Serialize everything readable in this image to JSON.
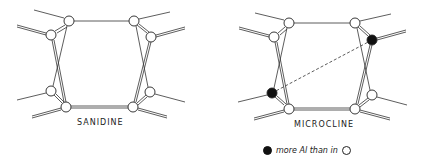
{
  "figure": {
    "panels": [
      {
        "id": "sanidine",
        "label": "SANIDINE",
        "nodes": [
          {
            "x": 69,
            "y": 21,
            "type": "open"
          },
          {
            "x": 51,
            "y": 35,
            "type": "open"
          },
          {
            "x": 134,
            "y": 21,
            "type": "open"
          },
          {
            "x": 151,
            "y": 37,
            "type": "open"
          },
          {
            "x": 51,
            "y": 91,
            "type": "open"
          },
          {
            "x": 66,
            "y": 107,
            "type": "open"
          },
          {
            "x": 133,
            "y": 107,
            "type": "open"
          },
          {
            "x": 150,
            "y": 92,
            "type": "open"
          }
        ]
      },
      {
        "id": "microcline",
        "label": "MICROCLINE",
        "nodes": [
          {
            "x": 289,
            "y": 23,
            "type": "open"
          },
          {
            "x": 274,
            "y": 37,
            "type": "open"
          },
          {
            "x": 355,
            "y": 23,
            "type": "open"
          },
          {
            "x": 372,
            "y": 40,
            "type": "filled"
          },
          {
            "x": 272,
            "y": 93,
            "type": "filled"
          },
          {
            "x": 289,
            "y": 109,
            "type": "open"
          },
          {
            "x": 355,
            "y": 109,
            "type": "open"
          },
          {
            "x": 372,
            "y": 95,
            "type": "open"
          }
        ],
        "dashed_link": {
          "from": [
            272,
            93
          ],
          "to": [
            372,
            40
          ]
        }
      }
    ],
    "legend": {
      "filled_symbol": "filled-circle",
      "text": "more Al than in",
      "open_symbol": "open-circle"
    },
    "colors": {
      "line": "#333333",
      "filled": "#111111",
      "background": "#ffffff"
    }
  }
}
